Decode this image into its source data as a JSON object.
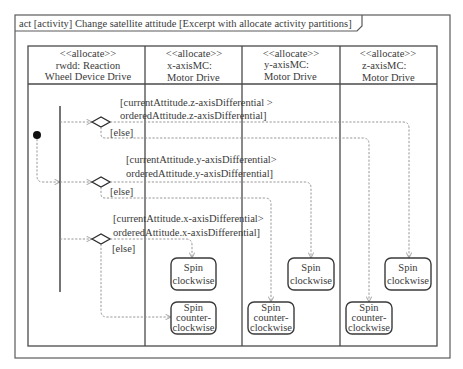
{
  "frame": {
    "title": "act [activity] Change satellite attitude [Excerpt with allocate activity partitions]"
  },
  "partitions": [
    {
      "stereotype": "<<allocate>>",
      "line1": "rwdd:  Reaction",
      "line2": "Wheel Device Drive"
    },
    {
      "stereotype": "<<allocate>>",
      "line1": "x-axisMC:",
      "line2": "Motor Drive"
    },
    {
      "stereotype": "<<allocate>>",
      "line1": "y-axisMC:",
      "line2": "Motor Drive"
    },
    {
      "stereotype": "<<allocate>>",
      "line1": "z-axisMC:",
      "line2": "Motor Drive"
    }
  ],
  "decisions": [
    {
      "axis": "z",
      "guard_line1": "[currentAttitude.z-axisDifferential >",
      "guard_line2": "orderedAttitude.z-axisDifferential]",
      "else_label": "[else]"
    },
    {
      "axis": "y",
      "guard_line1": "[currentAttitude.y-axisDifferential>",
      "guard_line2": "orderedAttitude.y-axisDifferential]",
      "else_label": "[else]"
    },
    {
      "axis": "x",
      "guard_line1": "[currentAttitude.x-axisDifferential>",
      "guard_line2": "orderedAttitude.x-axisDifferential]",
      "else_label": "[else]"
    }
  ],
  "actions": {
    "x_clockwise": {
      "line1": "Spin",
      "line2": "clockwise"
    },
    "x_counter": {
      "line1": "Spin",
      "line2": "counter-",
      "line3": "clockwise"
    },
    "y_clockwise": {
      "line1": "Spin",
      "line2": "clockwise"
    },
    "y_counter": {
      "line1": "Spin",
      "line2": "counter-",
      "line3": "clockwise"
    },
    "z_clockwise": {
      "line1": "Spin",
      "line2": "clockwise"
    },
    "z_counter": {
      "line1": "Spin",
      "line2": "counter-",
      "line3": "clockwise"
    }
  }
}
